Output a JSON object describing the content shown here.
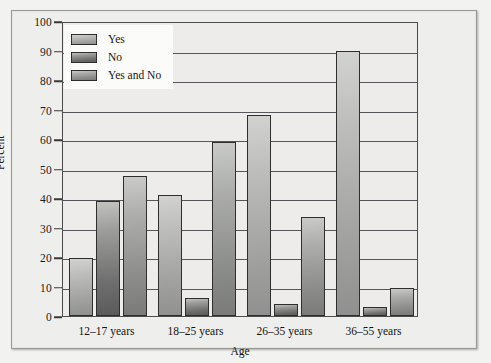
{
  "chart_data": {
    "type": "bar",
    "title": "",
    "xlabel": "Age",
    "ylabel": "Percent",
    "categories": [
      "12–17 years",
      "18–25 years",
      "26–35 years",
      "36–55 years"
    ],
    "series": [
      {
        "name": "Yes",
        "values": [
          19.5,
          41,
          68,
          90
        ]
      },
      {
        "name": "No",
        "values": [
          39,
          6,
          4,
          3
        ]
      },
      {
        "name": "Yes and No",
        "values": [
          47.5,
          59,
          33.5,
          9.5
        ]
      }
    ],
    "ylim": [
      0,
      100
    ],
    "yticks": [
      0,
      10,
      20,
      30,
      40,
      50,
      60,
      70,
      80,
      90,
      100
    ],
    "grid": true,
    "legend_position": "upper left",
    "colors": [
      "#b4b4b2",
      "#8a8a88",
      "#a0a09e"
    ]
  },
  "legend": {
    "items": [
      {
        "label": "Yes"
      },
      {
        "label": "No"
      },
      {
        "label": "Yes and No"
      }
    ]
  }
}
